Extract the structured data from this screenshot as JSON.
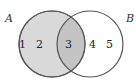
{
  "diagram": {
    "type": "venn",
    "sets": [
      {
        "name": "A",
        "label": "A",
        "shaded": true,
        "fill": "#d9d9d9",
        "stroke": "#555555"
      },
      {
        "name": "B",
        "label": "B",
        "shaded": false,
        "fill": "#ffffff",
        "stroke": "#555555"
      }
    ],
    "intersection_fill": "#c4c4c4",
    "regions": {
      "A_only": [
        "1",
        "2"
      ],
      "A_and_B": [
        "3"
      ],
      "B_only": [
        "4",
        "5"
      ]
    }
  }
}
